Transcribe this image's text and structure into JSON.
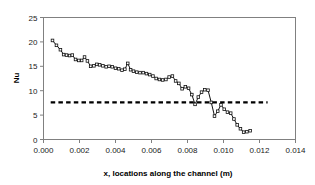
{
  "chart_data": {
    "type": "line",
    "title": "",
    "xlabel": "x, locations along the channel (m)",
    "ylabel": "Nu",
    "xlim": [
      0.0,
      0.014
    ],
    "ylim": [
      0,
      25
    ],
    "xticks": [
      0.0,
      0.002,
      0.004,
      0.006,
      0.008,
      0.01,
      0.012,
      0.014
    ],
    "xtick_labels": [
      "0.000",
      "0.002",
      "0.004",
      "0.006",
      "0.008",
      "0.010",
      "0.012",
      "0.014"
    ],
    "yticks": [
      0,
      5,
      10,
      15,
      20,
      25
    ],
    "ytick_labels": [
      "0",
      "5",
      "10",
      "15",
      "20",
      "25"
    ],
    "grid": false,
    "legend": "none",
    "series": [
      {
        "name": "Nu local",
        "marker": "open-square",
        "color": "#111111",
        "x": [
          0.0005,
          0.00072,
          0.00094,
          0.00112,
          0.00128,
          0.00145,
          0.0016,
          0.00178,
          0.00196,
          0.00212,
          0.00228,
          0.00244,
          0.00262,
          0.0028,
          0.00296,
          0.00312,
          0.0033,
          0.00348,
          0.00364,
          0.00382,
          0.004,
          0.00418,
          0.00436,
          0.00452,
          0.00468,
          0.00484,
          0.005,
          0.00518,
          0.00536,
          0.00554,
          0.00572,
          0.0059,
          0.00608,
          0.00626,
          0.00644,
          0.00662,
          0.0068,
          0.00698,
          0.00716,
          0.00734,
          0.00752,
          0.0077,
          0.00788,
          0.00806,
          0.00824,
          0.00842,
          0.0086,
          0.00878,
          0.00896,
          0.00914,
          0.00932,
          0.0095,
          0.00968,
          0.00986,
          0.01004,
          0.01022,
          0.0104,
          0.01058,
          0.01076,
          0.01094,
          0.01112,
          0.0113,
          0.01148
        ],
        "y": [
          20.3,
          19.3,
          18.4,
          17.4,
          17.3,
          17.2,
          17.3,
          16.4,
          16.2,
          16.2,
          16.9,
          16.1,
          15.0,
          15.1,
          15.4,
          15.3,
          15.1,
          14.9,
          15.0,
          14.9,
          14.6,
          14.5,
          14.2,
          14.4,
          15.6,
          14.3,
          14.0,
          13.8,
          13.7,
          13.7,
          13.5,
          13.3,
          13.0,
          12.5,
          12.3,
          12.2,
          12.3,
          12.8,
          13.0,
          12.0,
          11.5,
          10.4,
          10.8,
          10.5,
          9.2,
          7.2,
          8.7,
          9.7,
          10.2,
          10.1,
          7.6,
          4.8,
          5.8,
          7.1,
          6.2,
          5.6,
          5.4,
          4.2,
          3.0,
          2.2,
          1.5,
          1.6,
          1.8
        ]
      }
    ],
    "reference_line": {
      "name": "fully developed Nu",
      "value": 7.6,
      "style": "dashed",
      "color": "#000000",
      "x_start": 0.0004,
      "x_end": 0.01245
    }
  }
}
